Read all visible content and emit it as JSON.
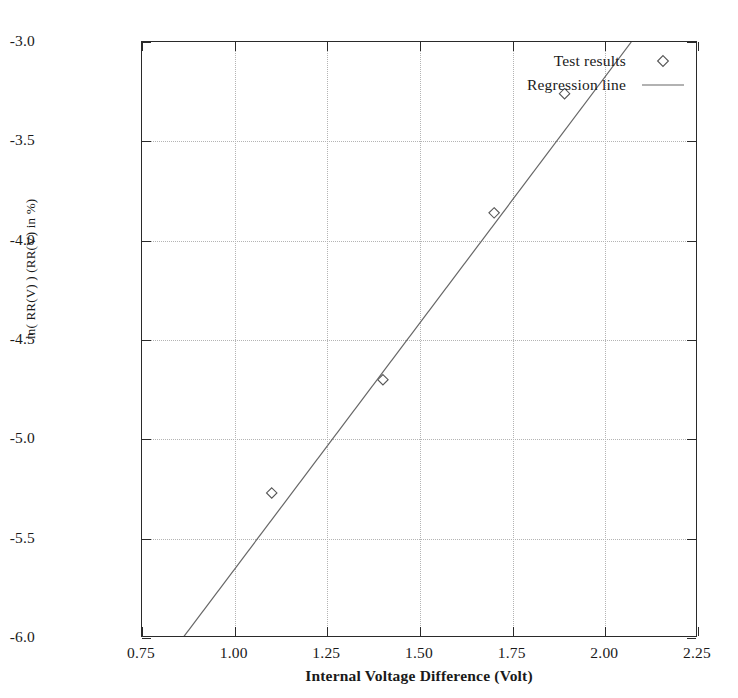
{
  "chart_data": {
    "type": "scatter",
    "title": "",
    "xlabel": "Internal Voltage Difference (Volt)",
    "ylabel": "ln( RR(V) ) (RR(V) in %)",
    "xlim": [
      0.75,
      2.25
    ],
    "ylim": [
      -6.0,
      -3.0
    ],
    "xticks": [
      "0.75",
      "1.00",
      "1.25",
      "1.50",
      "1.75",
      "2.00",
      "2.25"
    ],
    "xtick_values": [
      0.75,
      1.0,
      1.25,
      1.5,
      1.75,
      2.0,
      2.25
    ],
    "yticks": [
      "-3.0",
      "-3.5",
      "-4.0",
      "-4.5",
      "-5.0",
      "-5.5",
      "-6.0"
    ],
    "ytick_values": [
      -3.0,
      -3.5,
      -4.0,
      -4.5,
      -5.0,
      -5.5,
      -6.0
    ],
    "grid": true,
    "grid_style": "dotted",
    "legend_position": "top-right",
    "series": [
      {
        "name": "Test results",
        "type": "scatter",
        "marker": "diamond-open",
        "x": [
          1.1,
          1.4,
          1.7,
          1.89
        ],
        "y": [
          -5.27,
          -4.7,
          -3.86,
          -3.26
        ]
      },
      {
        "name": "Regression line",
        "type": "line",
        "x": [
          0.86,
          2.07
        ],
        "y": [
          -6.0,
          -3.0
        ],
        "slope": 2.48,
        "intercept": -8.13
      }
    ],
    "colors": {
      "axis": "#2a2a2a",
      "grid": "#b4b4b4",
      "marker": "#555555",
      "line": "#666666",
      "background": "#ffffff"
    }
  },
  "legend": {
    "items": [
      {
        "label": "Test results",
        "symbol": "diamond-marker"
      },
      {
        "label": "Regression line",
        "symbol": "line-sample"
      }
    ]
  }
}
